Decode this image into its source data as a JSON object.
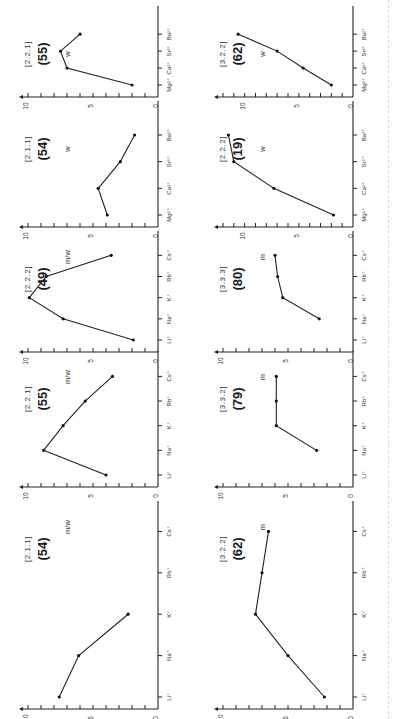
{
  "figure": {
    "orientation": "rotated 90 degrees counterclockwise",
    "ylabel": "log Kₛ",
    "yticks": [
      "0",
      "5",
      "10"
    ]
  },
  "chart_data": [
    {
      "type": "line",
      "title": "(54)",
      "ligand": "[2.1.1]",
      "selectivity": "m/w",
      "categories": [
        "Li⁺",
        "Na⁺",
        "K⁺",
        "Rb⁺",
        "Cs⁺"
      ],
      "values": [
        7.6,
        6.1,
        2.3,
        null,
        null
      ],
      "xlabel": "",
      "ylabel": "log Kₛ",
      "ylim": [
        0,
        10
      ]
    },
    {
      "type": "line",
      "title": "(55)",
      "ligand": "[2.2.1]",
      "selectivity": "m/w",
      "categories": [
        "Li⁺",
        "Na⁺",
        "K⁺",
        "Rb⁺",
        "Cs⁺"
      ],
      "values": [
        4.0,
        8.8,
        7.3,
        5.6,
        3.5
      ],
      "xlabel": "",
      "ylabel": "log Kₛ",
      "ylim": [
        0,
        10
      ]
    },
    {
      "type": "line",
      "title": "(49)",
      "ligand": "[2.2.2]",
      "selectivity": "m/w",
      "categories": [
        "Li⁺",
        "Na⁺",
        "K⁺",
        "Rb⁺",
        "Cs⁺"
      ],
      "values": [
        1.9,
        7.3,
        9.9,
        8.6,
        3.6
      ],
      "xlabel": "",
      "ylabel": "log Kₛ",
      "ylim": [
        0,
        10
      ]
    },
    {
      "type": "line",
      "title": "(54)",
      "ligand": "[2.1.1]",
      "selectivity": "w",
      "categories": [
        "Mg²⁺",
        "Ca²⁺",
        "Sr²⁺",
        "Ba²⁺"
      ],
      "values": [
        3.9,
        4.6,
        2.9,
        1.8
      ],
      "xlabel": "",
      "ylabel": "log Kₛ",
      "ylim": [
        0,
        10
      ]
    },
    {
      "type": "line",
      "title": "(55)",
      "ligand": "[2.2.1]",
      "selectivity": "w",
      "categories": [
        "Mg²⁺",
        "Ca²⁺",
        "Sr²⁺",
        "Ba²⁺"
      ],
      "values": [
        2.0,
        7.0,
        7.5,
        6.0
      ],
      "xlabel": "",
      "ylabel": "log Kₛ",
      "ylim": [
        0,
        10
      ]
    },
    {
      "type": "line",
      "title": "(62)",
      "ligand": "[3.2.2]",
      "selectivity": "m",
      "categories": [
        "Li⁺",
        "Na⁺",
        "K⁺",
        "Rb⁺",
        "Cs⁺"
      ],
      "values": [
        2.2,
        5.0,
        7.5,
        7.0,
        6.5
      ],
      "xlabel": "",
      "ylabel": "log Kₛ",
      "ylim": [
        0,
        10
      ]
    },
    {
      "type": "line",
      "title": "(79)",
      "ligand": "[3.3.2]",
      "selectivity": "m",
      "categories": [
        "Li⁺",
        "Na⁺",
        "K⁺",
        "Rb⁺",
        "Cs⁺"
      ],
      "values": [
        null,
        2.8,
        5.9,
        5.9,
        5.9
      ],
      "xlabel": "",
      "ylabel": "log Kₛ",
      "ylim": [
        0,
        10
      ]
    },
    {
      "type": "line",
      "title": "(80)",
      "ligand": "[3.3.3]",
      "selectivity": "m",
      "categories": [
        "Li⁺",
        "Na⁺",
        "K⁺",
        "Rb⁺",
        "Cs⁺"
      ],
      "values": [
        null,
        2.6,
        5.4,
        5.8,
        6.0
      ],
      "xlabel": "",
      "ylabel": "log Kₛ",
      "ylim": [
        0,
        10
      ]
    },
    {
      "type": "line",
      "title": "(19)",
      "ligand": "[2.2.2]",
      "selectivity": "w",
      "categories": [
        "Mg²⁺",
        "Ca²⁺",
        "Sr²⁺",
        "Ba²⁺"
      ],
      "values": [
        1.8,
        7.3,
        11.0,
        11.5
      ],
      "xlabel": "",
      "ylabel": "log Kₛ",
      "ylim": [
        0,
        12
      ]
    },
    {
      "type": "line",
      "title": "(62)",
      "ligand": "[3.2.2]",
      "selectivity": "w",
      "categories": [
        "Mg²⁺",
        "Ca²⁺",
        "Sr²⁺",
        "Ba²⁺"
      ],
      "values": [
        2.0,
        4.6,
        7.0,
        10.6
      ],
      "xlabel": "",
      "ylabel": "log Kₛ",
      "ylim": [
        0,
        12
      ]
    }
  ]
}
